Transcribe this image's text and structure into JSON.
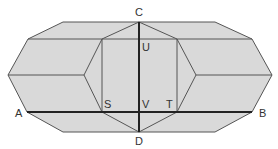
{
  "diagram": {
    "colors": {
      "fill": "#d9d9d9",
      "edge": "#555555",
      "bold_edge": "#222222",
      "label": "#333333"
    },
    "labels": {
      "A": "A",
      "B": "B",
      "C": "C",
      "D": "D",
      "S": "S",
      "T": "T",
      "U": "U",
      "V": "V"
    },
    "points": {
      "A": [
        27,
        112
      ],
      "B": [
        252,
        112
      ],
      "C": [
        139,
        22
      ],
      "D": [
        139,
        132
      ],
      "S": [
        102,
        112
      ],
      "T": [
        177,
        112
      ],
      "U": [
        139,
        39
      ],
      "V": [
        139,
        112
      ]
    }
  }
}
